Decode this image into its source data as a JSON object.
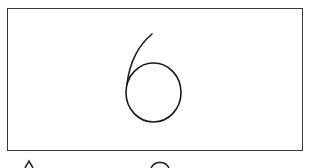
{
  "card": {
    "digit": "6",
    "stroke_color": "#1a1a1a",
    "border_color": "#3a3a3a"
  },
  "bottom_row": {
    "items": [
      {
        "shape": "triangle-peak",
        "partially_visible": true
      },
      {
        "shape": "circle-arc",
        "partially_visible": true
      }
    ]
  }
}
